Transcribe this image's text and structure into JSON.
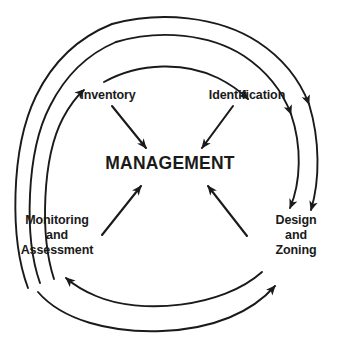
{
  "diagram": {
    "type": "cyclical-process",
    "center": {
      "id": "management",
      "label": "MANAGEMENT"
    },
    "nodes": [
      {
        "id": "inventory",
        "label": "Inventory",
        "lines": [
          "Inventory"
        ],
        "position": "top-left"
      },
      {
        "id": "identification",
        "label": "Identification",
        "lines": [
          "Identification"
        ],
        "position": "top-right"
      },
      {
        "id": "monitoring-assessment",
        "label": "Monitoring and Assessment",
        "lines": [
          "Monitoring",
          "and",
          "Assessment"
        ],
        "position": "bottom-left"
      },
      {
        "id": "design-zoning",
        "label": "Design and Zoning",
        "lines": [
          "Design",
          "and",
          "Zoning"
        ],
        "position": "bottom-right"
      }
    ],
    "inner_arrows": [
      {
        "from": "inventory",
        "to": "management"
      },
      {
        "from": "identification",
        "to": "management"
      },
      {
        "from": "monitoring-assessment",
        "to": "management"
      },
      {
        "from": "design-zoning",
        "to": "management"
      }
    ],
    "outer_arcs": [
      {
        "from": "monitoring-assessment",
        "to": "inventory",
        "side": "left"
      },
      {
        "from": "inventory",
        "to": "identification",
        "side": "top"
      },
      {
        "from": "identification",
        "to": "design-zoning",
        "side": "right"
      },
      {
        "from": "design-zoning",
        "to": "monitoring-assessment",
        "side": "bottom"
      }
    ],
    "colors": {
      "stroke": "#1a1a1a",
      "text": "#1a1a1a",
      "background": "#ffffff"
    }
  }
}
